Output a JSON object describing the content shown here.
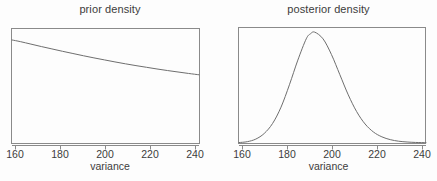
{
  "figure": {
    "background_color": "#fdfdfd",
    "line_color": "#6e6e6e",
    "frame_color": "#8a8a8a",
    "text_color": "#3c3c3c"
  },
  "panels": [
    {
      "id": "prior",
      "title": "prior density",
      "xlabel": "variance"
    },
    {
      "id": "posterior",
      "title": "posterior density",
      "xlabel": "variance"
    }
  ],
  "ticks": {
    "t0": "160",
    "t1": "180",
    "t2": "200",
    "t3": "220",
    "t4": "240"
  },
  "chart_data": [
    {
      "type": "line",
      "title": "prior density",
      "xlabel": "variance",
      "ylabel": "",
      "xlim": [
        156,
        245
      ],
      "ylim": [
        0,
        1
      ],
      "xticks": [
        160,
        180,
        200,
        220,
        240
      ],
      "grid": false,
      "legend": "none",
      "x": [
        156,
        160,
        165,
        170,
        175,
        180,
        185,
        190,
        195,
        200,
        205,
        210,
        215,
        220,
        225,
        230,
        235,
        240,
        245
      ],
      "y": [
        0.92,
        0.905,
        0.883,
        0.861,
        0.84,
        0.819,
        0.799,
        0.779,
        0.76,
        0.742,
        0.724,
        0.707,
        0.691,
        0.676,
        0.661,
        0.647,
        0.634,
        0.621,
        0.609
      ]
    },
    {
      "type": "line",
      "title": "posterior density",
      "xlabel": "variance",
      "ylabel": "",
      "xlim": [
        156,
        245
      ],
      "ylim": [
        0,
        1
      ],
      "xticks": [
        160,
        180,
        200,
        220,
        240
      ],
      "grid": false,
      "legend": "none",
      "peak_x": 190,
      "x": [
        156,
        160,
        164,
        168,
        172,
        176,
        180,
        184,
        188,
        190,
        192,
        196,
        200,
        204,
        208,
        212,
        216,
        220,
        224,
        228,
        232,
        236,
        240,
        245
      ],
      "y": [
        0.004,
        0.012,
        0.035,
        0.085,
        0.175,
        0.32,
        0.52,
        0.74,
        0.93,
        0.975,
        0.99,
        0.93,
        0.79,
        0.61,
        0.43,
        0.28,
        0.17,
        0.098,
        0.055,
        0.03,
        0.016,
        0.009,
        0.005,
        0.003
      ]
    }
  ]
}
